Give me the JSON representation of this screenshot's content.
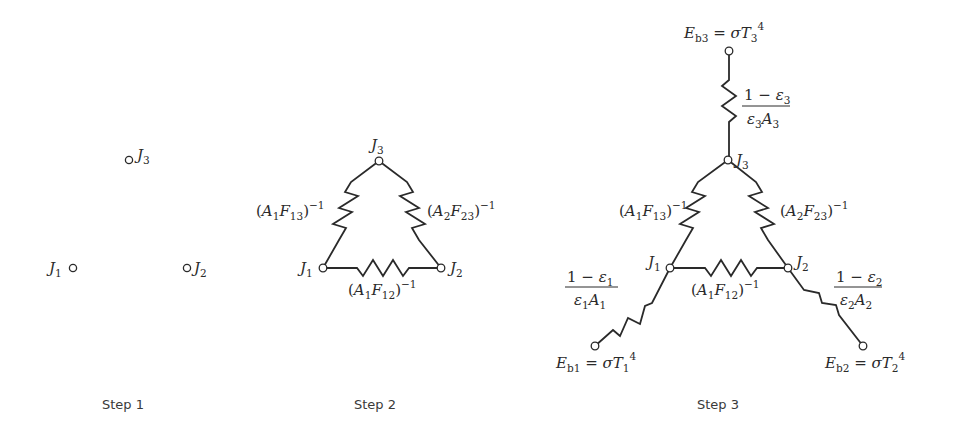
{
  "steps": [
    {
      "caption": "Step 1",
      "nodes": [
        {
          "id": "J1",
          "label": "J",
          "sub": "1",
          "x": 73,
          "y": 268
        },
        {
          "id": "J2",
          "label": "J",
          "sub": "2",
          "x": 187,
          "y": 268
        },
        {
          "id": "J3",
          "label": "J",
          "sub": "3",
          "x": 129,
          "y": 160
        }
      ]
    },
    {
      "caption": "Step 2",
      "nodes": [
        {
          "id": "J1",
          "label": "J",
          "sub": "1",
          "x": 323,
          "y": 268
        },
        {
          "id": "J2",
          "label": "J",
          "sub": "2",
          "x": 441,
          "y": 268
        },
        {
          "id": "J3",
          "label": "J",
          "sub": "3",
          "x": 379,
          "y": 161
        }
      ],
      "resistors": [
        {
          "between": [
            "J1",
            "J3"
          ],
          "label": "(A1F13)^-1",
          "parts": {
            "A": "A",
            "a_sub": "1",
            "F": "F",
            "f_sub": "13",
            "exp": "−1"
          }
        },
        {
          "between": [
            "J2",
            "J3"
          ],
          "label": "(A2F23)^-1",
          "parts": {
            "A": "A",
            "a_sub": "2",
            "F": "F",
            "f_sub": "23",
            "exp": "−1"
          }
        },
        {
          "between": [
            "J1",
            "J2"
          ],
          "label": "(A1F12)^-1",
          "parts": {
            "A": "A",
            "a_sub": "1",
            "F": "F",
            "f_sub": "12",
            "exp": "−1"
          }
        }
      ]
    },
    {
      "caption": "Step 3",
      "nodes": [
        {
          "id": "J1",
          "label": "J",
          "sub": "1",
          "x": 670,
          "y": 268
        },
        {
          "id": "J2",
          "label": "J",
          "sub": "2",
          "x": 788,
          "y": 268
        },
        {
          "id": "J3",
          "label": "J",
          "sub": "3",
          "x": 728,
          "y": 160
        },
        {
          "id": "Eb1",
          "x": 595,
          "y": 346
        },
        {
          "id": "Eb2",
          "x": 863,
          "y": 346
        },
        {
          "id": "Eb3",
          "x": 729,
          "y": 51
        }
      ],
      "resistors": [
        {
          "between": [
            "J1",
            "J3"
          ],
          "label": "(A1F13)^-1",
          "parts": {
            "A": "A",
            "a_sub": "1",
            "F": "F",
            "f_sub": "13",
            "exp": "−1"
          }
        },
        {
          "between": [
            "J2",
            "J3"
          ],
          "label": "(A2F23)^-1",
          "parts": {
            "A": "A",
            "a_sub": "2",
            "F": "F",
            "f_sub": "23",
            "exp": "−1"
          }
        },
        {
          "between": [
            "J1",
            "J2"
          ],
          "label": "(A1F12)^-1",
          "parts": {
            "A": "A",
            "a_sub": "1",
            "F": "F",
            "f_sub": "12",
            "exp": "−1"
          }
        },
        {
          "between": [
            "Eb3",
            "J3"
          ],
          "label": "(1 - ε3)/(ε3 A3)",
          "parts": {
            "num": "1 − ε",
            "num_sub": "3",
            "den_e": "ε",
            "den_e_sub": "3",
            "den_a": "A",
            "den_a_sub": "3"
          }
        },
        {
          "between": [
            "Eb1",
            "J1"
          ],
          "label": "(1 - ε1)/(ε1 A1)",
          "parts": {
            "num": "1 − ε",
            "num_sub": "1",
            "den_e": "ε",
            "den_e_sub": "1",
            "den_a": "A",
            "den_a_sub": "1"
          }
        },
        {
          "between": [
            "Eb2",
            "J2"
          ],
          "label": "(1 - ε2)/(ε2 A2)",
          "parts": {
            "num": "1 − ε",
            "num_sub": "2",
            "den_e": "ε",
            "den_e_sub": "2",
            "den_a": "A",
            "den_a_sub": "2"
          }
        }
      ],
      "sources": [
        {
          "id": "Eb3",
          "label": "Eb3 = σT3^4",
          "parts": {
            "E": "E",
            "e_sub": "b3",
            "eq": " = ",
            "sigma": "σ",
            "T": "T",
            "t_sub": "3",
            "exp": "4"
          }
        },
        {
          "id": "Eb1",
          "label": "Eb1 = σT1^4",
          "parts": {
            "E": "E",
            "e_sub": "b1",
            "eq": " = ",
            "sigma": "σ",
            "T": "T",
            "t_sub": "1",
            "exp": "4"
          }
        },
        {
          "id": "Eb2",
          "label": "Eb2 = σT2^4",
          "parts": {
            "E": "E",
            "e_sub": "b2",
            "eq": " = ",
            "sigma": "σ",
            "T": "T",
            "t_sub": "2",
            "exp": "4"
          }
        }
      ]
    }
  ],
  "colors": {
    "ink": "#2a2a2a",
    "caption": "#3a3a3a",
    "background": "#ffffff"
  }
}
